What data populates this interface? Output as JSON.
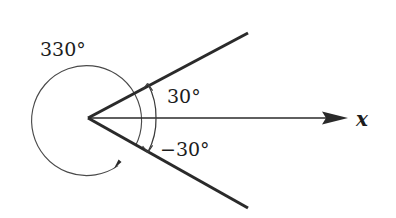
{
  "figure": {
    "type": "angle-diagram",
    "background_color": "#ffffff",
    "line_color": "#2a2a2a",
    "arc_color": "#4a4a4a",
    "vertex": {
      "x": 88,
      "y": 118
    },
    "axis": {
      "name": "x-axis",
      "label": "x",
      "start": {
        "x": 88,
        "y": 118
      },
      "arrow_tip": {
        "x": 348,
        "y": 118
      },
      "label_position": {
        "x": 356,
        "y": 126
      }
    },
    "rays": [
      {
        "name": "terminal-ray-upper",
        "angle_degrees": 30,
        "end": {
          "x": 248,
          "y": 33
        }
      },
      {
        "name": "terminal-ray-lower",
        "angle_degrees": -30,
        "end": {
          "x": 248,
          "y": 208
        }
      }
    ],
    "angle_arcs": [
      {
        "name": "arc-330",
        "label": "330°",
        "value": 330,
        "radius": 55,
        "direction": "counterclockwise",
        "from_angle_degrees": -30,
        "to_angle_degrees": 300,
        "label_position": {
          "x": 40,
          "y": 56
        }
      },
      {
        "name": "arc-30",
        "label": "30°",
        "value": 30,
        "radius": 68,
        "direction": "counterclockwise",
        "from_angle_degrees": 0,
        "to_angle_degrees": 30,
        "label_position": {
          "x": 167,
          "y": 103
        }
      },
      {
        "name": "arc-minus-30",
        "label": "−30°",
        "value": -30,
        "radius": 68,
        "direction": "clockwise",
        "from_angle_degrees": 0,
        "to_angle_degrees": -30,
        "label_position": {
          "x": 160,
          "y": 156
        }
      }
    ]
  }
}
